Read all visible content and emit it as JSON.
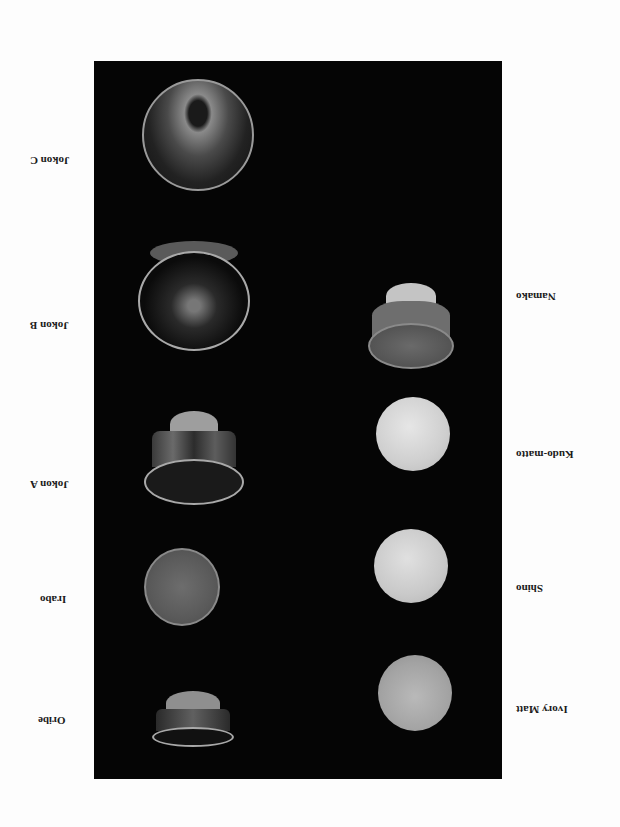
{
  "page": {
    "orientation": "rotated-180",
    "background": "#fdfdfd",
    "panel_color": "#050505"
  },
  "left_column": [
    {
      "label": "Jokon C",
      "style": "wide-open bowl, mottled interior"
    },
    {
      "label": "Jokon B",
      "style": "open bowl, dark interior with pale streaks"
    },
    {
      "label": "Jokon A",
      "style": "footed bowl, streaked dark glaze"
    },
    {
      "label": "Irabo",
      "style": "flat round disk, speckled texture"
    },
    {
      "label": "Oribe",
      "style": "low footed bowl, dark glaze"
    }
  ],
  "right_column": [
    {
      "label": "Namako",
      "style": "footed bowl, mid-gray glossy glaze"
    },
    {
      "label": "Kudo-matto",
      "style": "pale matte sphere"
    },
    {
      "label": "Shino",
      "style": "pale matte sphere"
    },
    {
      "label": "Ivory Matt",
      "style": "light gray matte sphere"
    }
  ]
}
